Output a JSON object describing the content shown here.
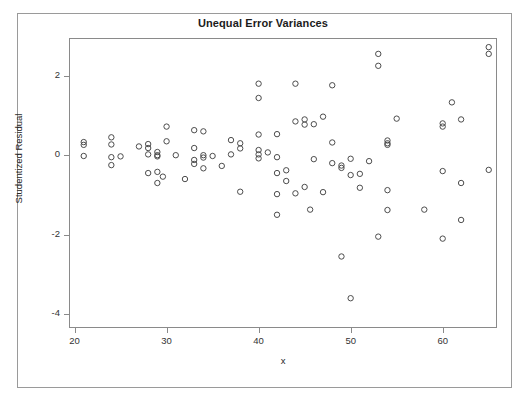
{
  "chart_data": {
    "type": "scatter",
    "title": "Unequal Error Variances",
    "xlabel": "x",
    "ylabel": "Studentized Residual",
    "xlim": [
      19.4,
      65.9
    ],
    "ylim": [
      -4.35,
      2.95
    ],
    "xticks": [
      20,
      30,
      40,
      50,
      60
    ],
    "yticks": [
      2,
      0,
      -2,
      -4
    ],
    "grid": false,
    "legend": null,
    "marker": "open-circle",
    "marker_color": "#4c4c4c",
    "points": [
      [
        21.0,
        0.33
      ],
      [
        21.0,
        0.26
      ],
      [
        21.0,
        -0.02
      ],
      [
        24.0,
        0.45
      ],
      [
        24.0,
        0.27
      ],
      [
        24.0,
        -0.05
      ],
      [
        24.0,
        -0.25
      ],
      [
        25.0,
        -0.03
      ],
      [
        27.0,
        0.22
      ],
      [
        28.0,
        0.28
      ],
      [
        28.0,
        0.18
      ],
      [
        28.0,
        0.02
      ],
      [
        28.0,
        -0.45
      ],
      [
        29.0,
        0.08
      ],
      [
        29.0,
        0.0
      ],
      [
        29.0,
        -0.03
      ],
      [
        29.0,
        -0.42
      ],
      [
        29.0,
        -0.7
      ],
      [
        29.6,
        -0.54
      ],
      [
        30.0,
        0.72
      ],
      [
        30.0,
        0.35
      ],
      [
        31.0,
        0.0
      ],
      [
        32.0,
        -0.6
      ],
      [
        33.0,
        0.63
      ],
      [
        33.0,
        0.18
      ],
      [
        33.0,
        -0.12
      ],
      [
        33.0,
        -0.22
      ],
      [
        34.0,
        0.6
      ],
      [
        34.0,
        0.0
      ],
      [
        34.0,
        -0.06
      ],
      [
        34.0,
        -0.33
      ],
      [
        35.0,
        -0.02
      ],
      [
        36.0,
        -0.27
      ],
      [
        37.0,
        0.38
      ],
      [
        37.0,
        0.02
      ],
      [
        38.0,
        0.3
      ],
      [
        38.0,
        0.17
      ],
      [
        38.0,
        -0.92
      ],
      [
        40.0,
        1.8
      ],
      [
        40.0,
        1.44
      ],
      [
        40.0,
        0.52
      ],
      [
        40.0,
        0.13
      ],
      [
        40.0,
        0.02
      ],
      [
        40.0,
        -0.08
      ],
      [
        41.0,
        0.07
      ],
      [
        42.0,
        0.53
      ],
      [
        42.0,
        -0.05
      ],
      [
        42.0,
        -0.45
      ],
      [
        42.0,
        -0.98
      ],
      [
        42.0,
        -1.5
      ],
      [
        43.0,
        -0.38
      ],
      [
        43.0,
        -0.65
      ],
      [
        44.0,
        1.8
      ],
      [
        44.0,
        0.85
      ],
      [
        44.0,
        -0.96
      ],
      [
        45.0,
        0.9
      ],
      [
        45.0,
        0.77
      ],
      [
        45.0,
        -0.8
      ],
      [
        45.6,
        -1.37
      ],
      [
        46.0,
        0.78
      ],
      [
        46.0,
        -0.1
      ],
      [
        47.0,
        0.97
      ],
      [
        47.0,
        -0.93
      ],
      [
        48.0,
        1.76
      ],
      [
        48.0,
        0.32
      ],
      [
        48.0,
        -0.2
      ],
      [
        49.0,
        -0.26
      ],
      [
        49.0,
        -0.32
      ],
      [
        49.0,
        -2.55
      ],
      [
        50.0,
        -0.09
      ],
      [
        50.0,
        -0.5
      ],
      [
        50.0,
        -3.6
      ],
      [
        51.0,
        -0.47
      ],
      [
        51.0,
        -0.82
      ],
      [
        52.0,
        -0.15
      ],
      [
        53.0,
        2.55
      ],
      [
        53.0,
        2.25
      ],
      [
        53.0,
        -2.05
      ],
      [
        54.0,
        0.37
      ],
      [
        54.0,
        0.3
      ],
      [
        54.0,
        0.26
      ],
      [
        54.0,
        -0.88
      ],
      [
        54.0,
        -1.38
      ],
      [
        55.0,
        0.92
      ],
      [
        58.0,
        -1.37
      ],
      [
        60.0,
        0.8
      ],
      [
        60.0,
        0.72
      ],
      [
        60.0,
        -0.4
      ],
      [
        60.0,
        -2.1
      ],
      [
        61.0,
        1.33
      ],
      [
        62.0,
        0.9
      ],
      [
        62.0,
        -0.7
      ],
      [
        62.0,
        -1.63
      ],
      [
        65.0,
        2.72
      ],
      [
        65.0,
        2.55
      ],
      [
        65.0,
        -0.37
      ]
    ]
  },
  "axes": {
    "xtick_labels": [
      "20",
      "30",
      "40",
      "50",
      "60"
    ],
    "ytick_labels": [
      "2",
      "0",
      "-2",
      "-4"
    ]
  }
}
